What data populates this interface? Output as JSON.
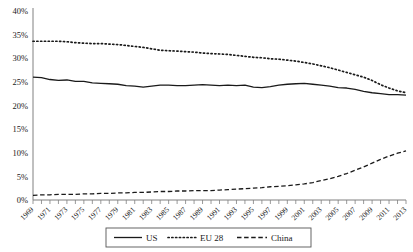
{
  "chart_data": {
    "type": "line",
    "title": "",
    "xlabel": "",
    "ylabel": "",
    "ylim": [
      0,
      40
    ],
    "yticks": [
      0,
      5,
      10,
      15,
      20,
      25,
      30,
      35,
      40
    ],
    "ytick_labels": [
      "0%",
      "5%",
      "10%",
      "15%",
      "20%",
      "25%",
      "30%",
      "35%",
      "40%"
    ],
    "xlim": [
      1969,
      2013
    ],
    "x": [
      1969,
      1970,
      1971,
      1972,
      1973,
      1974,
      1975,
      1976,
      1977,
      1978,
      1979,
      1980,
      1981,
      1982,
      1983,
      1984,
      1985,
      1986,
      1987,
      1988,
      1989,
      1990,
      1991,
      1992,
      1993,
      1994,
      1995,
      1996,
      1997,
      1998,
      1999,
      2000,
      2001,
      2002,
      2003,
      2004,
      2005,
      2006,
      2007,
      2008,
      2009,
      2010,
      2011,
      2012,
      2013
    ],
    "xtick_labels": [
      "1969",
      "1971",
      "1973",
      "1975",
      "1977",
      "1979",
      "1981",
      "1983",
      "1985",
      "1987",
      "1989",
      "1991",
      "1993",
      "1995",
      "1997",
      "1999",
      "2001",
      "2003",
      "2005",
      "2007",
      "2009",
      "2011",
      "2013"
    ],
    "xticks_labeled": [
      1969,
      1971,
      1973,
      1975,
      1977,
      1979,
      1981,
      1983,
      1985,
      1987,
      1989,
      1991,
      1993,
      1995,
      1997,
      1999,
      2001,
      2003,
      2005,
      2007,
      2009,
      2011,
      2013
    ],
    "grid": false,
    "legend_position": "bottom",
    "series": [
      {
        "name": "US",
        "style": "solid",
        "color": "#1a1a1a",
        "values": [
          26.0,
          25.9,
          25.5,
          25.3,
          25.4,
          25.1,
          25.1,
          24.8,
          24.7,
          24.6,
          24.5,
          24.2,
          24.1,
          23.9,
          24.1,
          24.3,
          24.3,
          24.2,
          24.2,
          24.3,
          24.4,
          24.3,
          24.2,
          24.3,
          24.2,
          24.3,
          23.9,
          23.8,
          24.0,
          24.3,
          24.5,
          24.6,
          24.7,
          24.5,
          24.3,
          24.1,
          23.8,
          23.7,
          23.4,
          23.0,
          22.7,
          22.5,
          22.3,
          22.3,
          22.2
        ]
      },
      {
        "name": "EU 28",
        "style": "dotted",
        "color": "#1a1a1a",
        "values": [
          33.6,
          33.6,
          33.6,
          33.6,
          33.5,
          33.3,
          33.2,
          33.1,
          33.1,
          33.0,
          32.9,
          32.7,
          32.5,
          32.3,
          32.0,
          31.7,
          31.6,
          31.5,
          31.4,
          31.3,
          31.1,
          31.0,
          30.9,
          30.8,
          30.6,
          30.4,
          30.2,
          30.1,
          29.9,
          29.8,
          29.6,
          29.4,
          29.1,
          28.8,
          28.4,
          28.0,
          27.5,
          27.0,
          26.5,
          26.0,
          25.3,
          24.4,
          23.7,
          23.1,
          22.7
        ]
      },
      {
        "name": "China",
        "style": "dashed",
        "color": "#1a1a1a",
        "values": [
          1.0,
          1.1,
          1.1,
          1.2,
          1.2,
          1.2,
          1.3,
          1.3,
          1.4,
          1.4,
          1.5,
          1.5,
          1.6,
          1.6,
          1.7,
          1.8,
          1.8,
          1.9,
          1.9,
          2.0,
          2.0,
          2.0,
          2.1,
          2.2,
          2.3,
          2.4,
          2.5,
          2.6,
          2.8,
          2.9,
          3.0,
          3.2,
          3.4,
          3.7,
          4.1,
          4.5,
          5.0,
          5.6,
          6.3,
          7.0,
          7.8,
          8.6,
          9.3,
          9.9,
          10.4
        ]
      }
    ]
  },
  "legend": {
    "items": [
      {
        "label": "US",
        "style": "solid"
      },
      {
        "label": "EU 28",
        "style": "dotted"
      },
      {
        "label": "China",
        "style": "dashed"
      }
    ]
  }
}
